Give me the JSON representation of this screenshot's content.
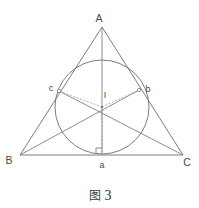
{
  "figure": {
    "caption_glyph": "图",
    "caption_number": "3",
    "type": "geometry-diagram"
  },
  "colors": {
    "stroke": "#6e6e6e",
    "dashed_stroke": "#8f8f8f",
    "circle_stroke": "#6e6e6e",
    "label_text": "#4a4a4a",
    "background": "#ffffff"
  },
  "labels": {
    "vertex_a": "A",
    "vertex_b": "B",
    "vertex_c": "C",
    "touch_a": "a",
    "touch_b": "b",
    "touch_c": "c",
    "incenter": "I"
  },
  "geometry": {
    "triangle": {
      "A": [
        102,
        27
      ],
      "B": [
        20,
        155
      ],
      "C": [
        183,
        155
      ]
    },
    "incircle": {
      "center": [
        102,
        107
      ],
      "radius": 47
    },
    "tangent_points": {
      "a": [
        102,
        154
      ],
      "b": [
        139,
        90
      ],
      "c": [
        59,
        91
      ]
    },
    "cevians": [
      {
        "from": "A",
        "to": "a"
      },
      {
        "from": "B",
        "to": "b"
      },
      {
        "from": "C",
        "to": "c"
      }
    ],
    "radii_dashed": [
      {
        "from": "I",
        "to": "a"
      },
      {
        "from": "I",
        "to": "b"
      },
      {
        "from": "I",
        "to": "c"
      }
    ],
    "right_angle_marker_at": "a"
  },
  "label_positions": {
    "A": [
      99,
      22
    ],
    "B": [
      9,
      163
    ],
    "C": [
      183,
      165
    ],
    "a": [
      99,
      167
    ],
    "b": [
      146,
      90
    ],
    "c": [
      48,
      90
    ],
    "I": [
      104,
      96
    ]
  }
}
